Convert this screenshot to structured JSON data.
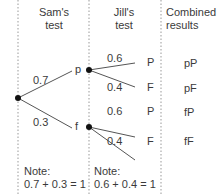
{
  "headers": {
    "sam": [
      "Sam's",
      "test"
    ],
    "jill": [
      "Jill's",
      "test"
    ],
    "combined": [
      "Combined",
      "results"
    ]
  },
  "sam_branches": {
    "upper_prob": "0.7",
    "lower_prob": "0.3",
    "upper_outcome": "p",
    "lower_outcome": "f"
  },
  "jill_branches": {
    "p_upper_prob": "0.6",
    "p_lower_prob": "0.4",
    "f_upper_prob": "0.6",
    "f_lower_prob": "0.4",
    "outcome_pass": "P",
    "outcome_fail": "F"
  },
  "results": [
    "pP",
    "pF",
    "fP",
    "fF"
  ],
  "notes": {
    "sam": [
      "Note:",
      "0.7 + 0.3 = 1"
    ],
    "jill": [
      "Note:",
      "0.6 + 0.4 = 1"
    ]
  },
  "colors": {
    "line": "#555555",
    "dot": "#111111",
    "divider": "#999999"
  }
}
